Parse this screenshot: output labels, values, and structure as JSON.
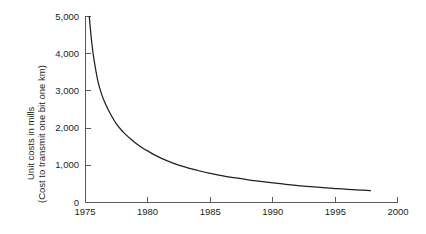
{
  "chart_data": {
    "type": "line",
    "title": "",
    "subtitle": "",
    "xlabel": "",
    "ylabel_line1": "Unit costs in mills",
    "ylabel_line2": "(Cost to transmit one bit one km)",
    "xlim": [
      1975,
      2000
    ],
    "ylim": [
      0,
      5000
    ],
    "grid": false,
    "legend": false,
    "legend_position": "none",
    "x_ticks": [
      1975,
      1980,
      1985,
      1990,
      1995,
      2000
    ],
    "x_tick_labels": [
      "1975",
      "1980",
      "1985",
      "1990",
      "1995",
      "2000"
    ],
    "y_ticks": [
      0,
      1000,
      2000,
      3000,
      4000,
      5000
    ],
    "y_tick_labels": [
      "0",
      "1,000",
      "2,000",
      "3,000",
      "4,000",
      "5,000"
    ],
    "series": [
      {
        "name": "Unit cost to transmit one bit one km",
        "color": "#231f20",
        "x": [
          1975.3,
          1975.5,
          1975.7,
          1976.0,
          1976.3,
          1976.6,
          1977.0,
          1977.5,
          1978.0,
          1978.5,
          1979.0,
          1979.5,
          1980.0,
          1981.0,
          1982.0,
          1983.0,
          1984.0,
          1985.0,
          1986.0,
          1987.0,
          1988.0,
          1989.0,
          1990.0,
          1991.0,
          1992.0,
          1993.0,
          1994.0,
          1995.0,
          1996.0,
          1997.0,
          1997.8
        ],
        "values": [
          5000,
          4300,
          3800,
          3250,
          2900,
          2650,
          2380,
          2100,
          1900,
          1740,
          1600,
          1480,
          1380,
          1200,
          1060,
          950,
          860,
          780,
          715,
          660,
          610,
          570,
          530,
          490,
          455,
          425,
          400,
          375,
          355,
          335,
          320
        ]
      }
    ],
    "annotations": []
  },
  "colors": {
    "background": "#ffffff",
    "axis": "#58595b",
    "text": "#231f20",
    "curve": "#231f20"
  }
}
